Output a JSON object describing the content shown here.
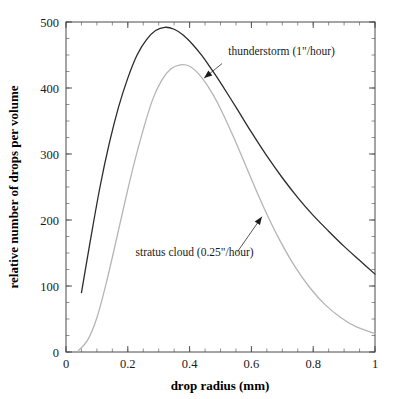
{
  "chart_data": {
    "type": "line",
    "title": "",
    "xlabel": "drop radius  (mm)",
    "ylabel": "relative number of drops per volume",
    "xlim": [
      0,
      1
    ],
    "ylim": [
      0,
      500
    ],
    "grid": false,
    "legend_position": "inline-annotations",
    "xticks": [
      0,
      0.2,
      0.4,
      0.6,
      0.8,
      1
    ],
    "xtick_labels": [
      "0",
      "0.2",
      "0.4",
      "0.6",
      "0.8",
      "1"
    ],
    "xticks_minor_step": 0.05,
    "yticks": [
      0,
      100,
      200,
      300,
      400,
      500
    ],
    "ytick_labels": [
      "0",
      "100",
      "200",
      "300",
      "400",
      "500"
    ],
    "yticks_minor_step": 25,
    "series": [
      {
        "name": "thunderstorm (1\"/hour)",
        "color": "#2b2b2b",
        "linewidth": 1.3,
        "peak_x": 0.33,
        "peak_y": 492,
        "x": [
          0.05,
          0.08,
          0.11,
          0.14,
          0.17,
          0.2,
          0.23,
          0.26,
          0.29,
          0.32,
          0.35,
          0.38,
          0.41,
          0.44,
          0.47,
          0.5,
          0.55,
          0.6,
          0.65,
          0.7,
          0.75,
          0.8,
          0.85,
          0.9,
          0.95,
          1.0
        ],
        "y": [
          90,
          172,
          250,
          316,
          371,
          415,
          450,
          473,
          487,
          492,
          489,
          480,
          466,
          449,
          429,
          408,
          371,
          333,
          297,
          264,
          234,
          207,
          183,
          160,
          139,
          118
        ]
      },
      {
        "name": "stratus cloud (0.25\"/hour)",
        "color": "#b5b5b5",
        "linewidth": 1.3,
        "peak_x": 0.385,
        "peak_y": 435,
        "x": [
          0.04,
          0.07,
          0.1,
          0.13,
          0.16,
          0.19,
          0.22,
          0.25,
          0.28,
          0.31,
          0.34,
          0.37,
          0.4,
          0.43,
          0.46,
          0.49,
          0.54,
          0.59,
          0.64,
          0.69,
          0.74,
          0.79,
          0.84,
          0.89,
          0.94,
          1.0
        ],
        "y": [
          2,
          18,
          52,
          104,
          164,
          226,
          285,
          337,
          382,
          412,
          429,
          435,
          433,
          421,
          402,
          378,
          328,
          273,
          219,
          171,
          130,
          97,
          71,
          52,
          38,
          28
        ]
      }
    ],
    "annotations": [
      {
        "name": "thunderstorm-annotation",
        "text": "thunderstorm (1\"/hour)",
        "label_x": 0.525,
        "label_y": 450,
        "arrow_from_x": 0.505,
        "arrow_from_y": 437,
        "arrow_to_x": 0.447,
        "arrow_to_y": 415
      },
      {
        "name": "stratus-cloud-annotation",
        "text": "stratus cloud (0.25\"/hour)",
        "label_x": 0.225,
        "label_y": 146,
        "arrow_from_x": 0.555,
        "arrow_from_y": 152,
        "arrow_to_x": 0.634,
        "arrow_to_y": 205
      }
    ]
  }
}
